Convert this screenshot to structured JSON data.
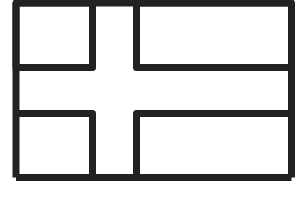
{
  "diagram": {
    "title": "",
    "type": "nordic-cross-flag-outline",
    "stroke_color": "#222222",
    "fill_color": "#ffffff",
    "cells": [
      {
        "name": "top-left-panel"
      },
      {
        "name": "top-right-panel"
      },
      {
        "name": "bottom-left-panel"
      },
      {
        "name": "bottom-right-panel"
      }
    ]
  }
}
